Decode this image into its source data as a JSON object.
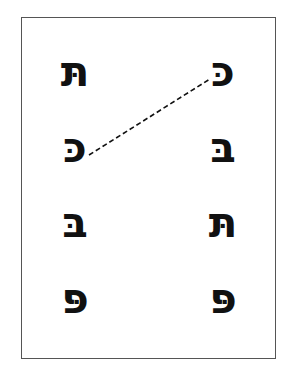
{
  "worksheet": {
    "columns": {
      "left": [
        {
          "letter": "תּ",
          "name": "tav-dagesh"
        },
        {
          "letter": "כּ",
          "name": "kaf-dagesh"
        },
        {
          "letter": "בּ",
          "name": "bet-dagesh"
        },
        {
          "letter": "פּ",
          "name": "pe-dagesh"
        }
      ],
      "right": [
        {
          "letter": "כּ",
          "name": "kaf-dagesh"
        },
        {
          "letter": "בּ",
          "name": "bet-dagesh"
        },
        {
          "letter": "תּ",
          "name": "tav-dagesh"
        },
        {
          "letter": "פּ",
          "name": "pe-dagesh"
        }
      ]
    },
    "example_match": {
      "from": "left.1",
      "to": "right.0",
      "style": "dashed"
    },
    "colors": {
      "ink": "#111111",
      "border": "#555555",
      "background": "#ffffff"
    }
  }
}
